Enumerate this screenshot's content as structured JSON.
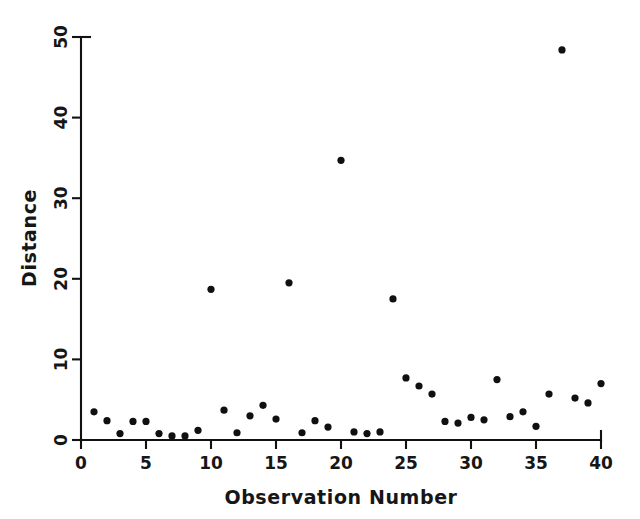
{
  "chart_data": {
    "type": "scatter",
    "title": "",
    "xlabel": "Observation Number",
    "ylabel": "Distance",
    "xlim": [
      0,
      40
    ],
    "ylim": [
      0,
      50
    ],
    "xticks": [
      0,
      5,
      10,
      15,
      20,
      25,
      30,
      35,
      40
    ],
    "yticks": [
      0,
      10,
      20,
      30,
      40,
      50
    ],
    "xtick_labels": [
      "0",
      "5",
      "10",
      "15",
      "20",
      "25",
      "30",
      "35",
      "40"
    ],
    "ytick_labels": [
      "0",
      "10",
      "20",
      "30",
      "40",
      "50"
    ],
    "grid": false,
    "legend": null,
    "marker": "filled-circle",
    "marker_color": "#101010",
    "x": [
      1,
      2,
      3,
      4,
      5,
      6,
      7,
      8,
      9,
      10,
      11,
      12,
      13,
      14,
      15,
      16,
      17,
      18,
      19,
      20,
      21,
      22,
      23,
      24,
      25,
      26,
      27,
      28,
      29,
      30,
      31,
      32,
      33,
      34,
      35,
      36,
      37,
      38,
      39,
      40
    ],
    "y": [
      3.5,
      2.4,
      0.8,
      2.3,
      2.3,
      0.8,
      0.5,
      0.5,
      1.2,
      18.7,
      3.7,
      0.9,
      3.0,
      4.3,
      2.6,
      19.5,
      0.9,
      2.4,
      1.6,
      34.7,
      1.0,
      0.8,
      1.0,
      17.5,
      7.7,
      6.7,
      5.7,
      2.3,
      2.1,
      2.8,
      2.5,
      7.5,
      2.9,
      3.5,
      1.7,
      5.7,
      48.4,
      5.2,
      4.6,
      7.0
    ],
    "axis_color": "#111111",
    "background": "#ffffff"
  },
  "figure": {
    "plot_left_px": 81,
    "plot_right_px": 601,
    "plot_bottom_px": 440,
    "plot_top_px": 37
  }
}
